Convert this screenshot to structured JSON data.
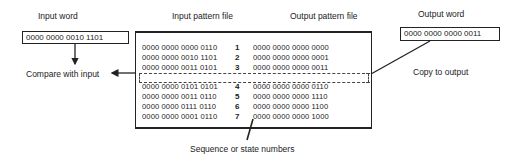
{
  "labels": {
    "input_word": "Input word",
    "input_pattern_file": "Input pattern file",
    "output_pattern_file": "Output pattern file",
    "output_word": "Output word",
    "compare_with_input": "Compare with input",
    "copy_to_output": "Copy to output",
    "sequence_numbers": "Sequence or state numbers"
  },
  "input_word": "0000 0000 0010 1101",
  "output_word": "0000 0000 0000 0011",
  "highlighted_row": 3,
  "rows": [
    {
      "input": "0000 0000 0000 0110",
      "seq": "1",
      "output": "0000 0000 0000 0000"
    },
    {
      "input": "0000 0000 0010 1101",
      "seq": "2",
      "output": "0000 0000 0000 0001"
    },
    {
      "input": "0000 0000 0011 0101",
      "seq": "3",
      "output": "0000 0000 0000 0011"
    },
    {
      "input": "0000 0000 0101 0101",
      "seq": "4",
      "output": "0000 0000 0000 0110"
    },
    {
      "input": "0000 0000 0011 0110",
      "seq": "5",
      "output": "0000 0000 0000 1110"
    },
    {
      "input": "0000 0000 0111 0110",
      "seq": "6",
      "output": "0000 0000 0000 1100"
    },
    {
      "input": "0000 0000 0001 0110",
      "seq": "7",
      "output": "0000 0000 0000 1000"
    }
  ],
  "colors": {
    "ink": "#222222",
    "background": "#ffffff"
  }
}
